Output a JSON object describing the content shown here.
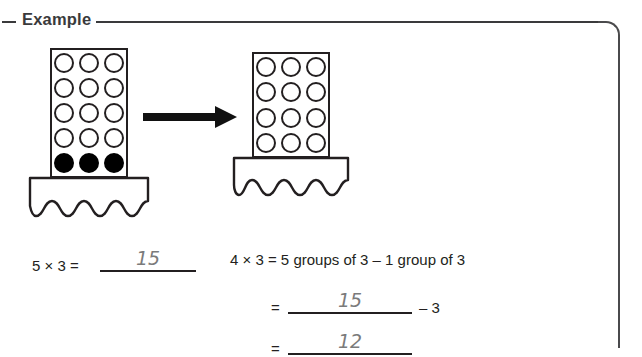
{
  "header": {
    "label": "Example"
  },
  "diagram": {
    "left_apparatus": {
      "name": "five-groups-of-three-counter",
      "columns": 3,
      "rows": 5,
      "open_beads": 12,
      "filled_beads": 3,
      "bead_pattern": [
        [
          "open",
          "open",
          "open"
        ],
        [
          "open",
          "open",
          "open"
        ],
        [
          "open",
          "open",
          "open"
        ],
        [
          "open",
          "open",
          "open"
        ],
        [
          "filled",
          "filled",
          "filled"
        ]
      ]
    },
    "right_apparatus": {
      "name": "four-groups-of-three-counter",
      "columns": 3,
      "rows": 4,
      "open_beads": 12,
      "filled_beads": 0,
      "bead_pattern": [
        [
          "open",
          "open",
          "open"
        ],
        [
          "open",
          "open",
          "open"
        ],
        [
          "open",
          "open",
          "open"
        ],
        [
          "open",
          "open",
          "open"
        ]
      ]
    },
    "arrow": {
      "name": "transformation-arrow",
      "direction": "right"
    }
  },
  "equations": {
    "left": {
      "prompt": "5 × 3 =",
      "answer": "15"
    },
    "right": {
      "line1": "4 × 3 = 5 groups of 3 – 1 group of 3",
      "line2_prefix": "=",
      "line2_answer": "15",
      "line2_suffix": "– 3",
      "line3_prefix": "=",
      "line3_answer": "12"
    }
  },
  "colors": {
    "ink": "#231f20",
    "header_gray": "#3a3a3c",
    "handwriting_gray": "#7b7b7b",
    "border_gray": "#4a4a4c"
  }
}
